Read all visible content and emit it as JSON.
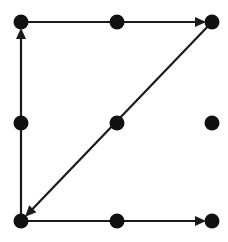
{
  "canvas": {
    "width": 228,
    "height": 242,
    "background_color": "#ffffff",
    "title": "Directed graph on a 3x3 grid of nodes"
  },
  "style": {
    "node_color": "#111111",
    "node_radius": 7.5,
    "edge_color": "#1a1a1a",
    "edge_width": 2.2,
    "arrow_length": 11,
    "arrow_half_width": 5
  },
  "grid": {
    "columns_x": [
      21,
      117,
      212
    ],
    "rows_y": [
      22,
      123,
      221
    ],
    "column_names": [
      "left",
      "center",
      "right"
    ],
    "row_names": [
      "top",
      "middle",
      "bottom"
    ]
  },
  "nodes": [
    {
      "id": "top-left",
      "label": "top-left",
      "x": 21,
      "y": 22,
      "degree": 2,
      "isolated": false
    },
    {
      "id": "top-center",
      "label": "top-center",
      "x": 117,
      "y": 22,
      "degree": 2,
      "isolated": false
    },
    {
      "id": "top-right",
      "label": "top-right",
      "x": 212,
      "y": 22,
      "degree": 2,
      "isolated": false
    },
    {
      "id": "middle-left",
      "label": "middle-left",
      "x": 21,
      "y": 123,
      "degree": 2,
      "isolated": false
    },
    {
      "id": "middle-center",
      "label": "middle-center",
      "x": 117,
      "y": 123,
      "degree": 2,
      "isolated": false
    },
    {
      "id": "middle-right",
      "label": "middle-right",
      "x": 212,
      "y": 123,
      "degree": 0,
      "isolated": true
    },
    {
      "id": "bottom-left",
      "label": "bottom-left",
      "x": 21,
      "y": 221,
      "degree": 3,
      "isolated": false
    },
    {
      "id": "bottom-center",
      "label": "bottom-center",
      "x": 117,
      "y": 221,
      "degree": 2,
      "isolated": false
    },
    {
      "id": "bottom-right",
      "label": "bottom-right",
      "x": 212,
      "y": 221,
      "degree": 1,
      "isolated": false
    }
  ],
  "edges": [
    {
      "id": "edge-top",
      "from": "top-left",
      "to": "top-right",
      "orientation": "horizontal",
      "directed": true,
      "arrow_at": "to",
      "passes_through": [
        "top-center"
      ],
      "x1": 21,
      "y1": 22,
      "x2": 212,
      "y2": 22
    },
    {
      "id": "edge-left",
      "from": "bottom-left",
      "to": "top-left",
      "orientation": "vertical",
      "directed": true,
      "arrow_at": "to",
      "passes_through": [
        "middle-left"
      ],
      "x1": 21,
      "y1": 221,
      "x2": 21,
      "y2": 22
    },
    {
      "id": "edge-diagonal",
      "from": "top-right",
      "to": "bottom-left",
      "orientation": "diagonal",
      "directed": true,
      "arrow_at": "to",
      "passes_through": [
        "middle-center"
      ],
      "x1": 212,
      "y1": 22,
      "x2": 21,
      "y2": 221
    },
    {
      "id": "edge-bottom",
      "from": "bottom-left",
      "to": "bottom-right",
      "orientation": "horizontal",
      "directed": true,
      "arrow_at": "to",
      "passes_through": [
        "bottom-center"
      ],
      "x1": 21,
      "y1": 221,
      "x2": 212,
      "y2": 221
    }
  ]
}
